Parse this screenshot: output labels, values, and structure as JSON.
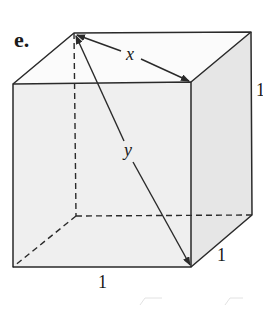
{
  "figure": {
    "part_label": "e.",
    "shape": "unit cube",
    "diagonal_labels": {
      "face_diagonal": "x",
      "space_diagonal": "y"
    },
    "edge_labels": {
      "height": "1",
      "depth": "1",
      "width": "1"
    },
    "colors": {
      "stroke": "#2a2a2a",
      "front_face": "#efefef",
      "side_face": "#e6e6e6",
      "top_face": "#fbfbfb",
      "background": "#ffffff"
    }
  }
}
